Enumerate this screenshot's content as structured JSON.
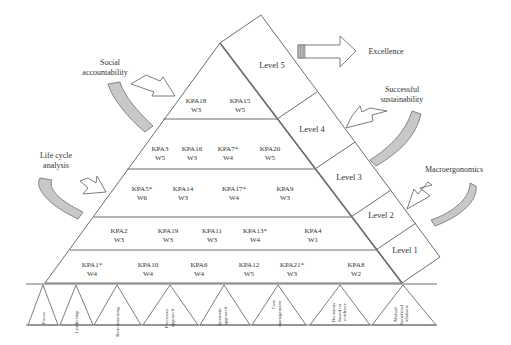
{
  "diagram": {
    "colors": {
      "line": "#6e6e6e",
      "text": "#333333",
      "arrow_fill": "#c8c8c8",
      "background": "#ffffff"
    },
    "levels": [
      {
        "label": "Level 5"
      },
      {
        "label": "Level 4"
      },
      {
        "label": "Level 3"
      },
      {
        "label": "Level 2"
      },
      {
        "label": "Level 1"
      }
    ],
    "rows": [
      {
        "level": 5,
        "items": [
          {
            "kpa": "KPA18",
            "w": "W3"
          },
          {
            "kpa": "KPA15",
            "w": "W5"
          }
        ]
      },
      {
        "level": 4,
        "items": [
          {
            "kpa": "KPA3",
            "w": "W5"
          },
          {
            "kpa": "KPA16",
            "w": "W3"
          },
          {
            "kpa": "KPA7*",
            "w": "W4"
          },
          {
            "kpa": "KPA20",
            "w": "W5"
          }
        ]
      },
      {
        "level": 3,
        "items": [
          {
            "kpa": "KPA5*",
            "w": "W6"
          },
          {
            "kpa": "KPA14",
            "w": "W3"
          },
          {
            "kpa": "KPA17*",
            "w": "W4"
          },
          {
            "kpa": "KPA9",
            "w": "W3"
          }
        ]
      },
      {
        "level": 2,
        "items": [
          {
            "kpa": "KPA2",
            "w": "W3"
          },
          {
            "kpa": "KPA19",
            "w": "W3"
          },
          {
            "kpa": "KPA11",
            "w": "W3"
          },
          {
            "kpa": "KPA13*",
            "w": "W4"
          },
          {
            "kpa": "KPA4",
            "w": "W1"
          }
        ]
      },
      {
        "level": 1,
        "items": [
          {
            "kpa": "KPA1*",
            "w": "W4"
          },
          {
            "kpa": "KPA10",
            "w": "W4"
          },
          {
            "kpa": "KPA6",
            "w": "W4"
          },
          {
            "kpa": "KPA12",
            "w": "W5"
          },
          {
            "kpa": "KPA21*",
            "w": "W3"
          },
          {
            "kpa": "KPA8",
            "w": "W2"
          }
        ]
      }
    ],
    "side_labels": {
      "excellence": "Excellence",
      "social_accountability": [
        "Social",
        "accountability"
      ],
      "successful_sustainability": [
        "Successful",
        "sustainability"
      ],
      "life_cycle_analysis": [
        "Life cycle",
        "analysis"
      ],
      "macroergonomics": "Macroergonomics"
    },
    "base_principles": [
      [
        "Focus"
      ],
      [
        "Leadership"
      ],
      [
        "Benchmarking"
      ],
      [
        "Processes",
        "approach"
      ],
      [
        "Systemic",
        "approach"
      ],
      [
        "Cost",
        "management"
      ],
      [
        "Decisions",
        "based on",
        "evidence"
      ],
      [
        "Mutual",
        "beneficial",
        "relations"
      ]
    ]
  }
}
